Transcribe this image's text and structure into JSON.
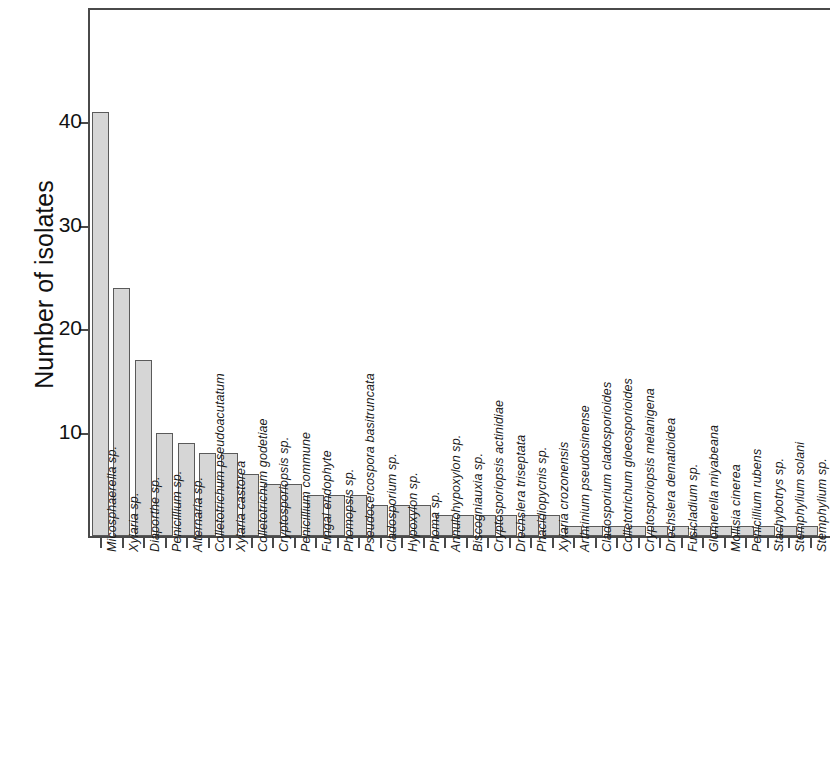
{
  "chart_data": {
    "type": "bar",
    "title": "",
    "xlabel": "",
    "ylabel": "Number of isolates",
    "ylim": [
      0,
      49
    ],
    "yticks": [
      10,
      20,
      30,
      40
    ],
    "ytick_labels": [
      "10",
      "20",
      "30",
      "40"
    ],
    "grid": false,
    "legend": false,
    "orientation": "vertical",
    "bar_color": "#d6d6d6",
    "bar_edge_color": "#5a5a5a",
    "axis_color": "#4a4a4a",
    "categories": [
      "Micosphaerella sp.",
      "Xylaria sp.",
      "Diaporthe sp.",
      "Penicillium sp.",
      "Alternaria sp.",
      "Colletotrichum pseudoacutatum",
      "Xylaria castorea",
      "Colletotrichum godetiae",
      "Cryptosporiopsis sp.",
      "Penicillium commune",
      "Fungal endophyte",
      "Phomopsis sp.",
      "Pseudocercospora basitruncata",
      "Cladosporium sp.",
      "Hypoxylon sp.",
      "Phoma sp.",
      "Annulohypoxylon sp.",
      "Biscogniauxia sp.",
      "Cryptosporiopsis actinidiae",
      "Drechslera triseptata",
      "Phacidiopycnis sp.",
      "Xylaria crozonensis",
      "Arthrinium pseudosinense",
      "Cladosporium cladosporioides",
      "Colletotrichum gloeosporioides",
      "Cryptosporiopsis melanigena",
      "Drechslera dematioidea",
      "Fusicladium sp.",
      "Glomerella miyabeana",
      "Mollisia cinerea",
      "Penicillium rubens",
      "Stachybotrys sp.",
      "Stemphylium solani",
      "Stemphylium sp."
    ],
    "values": [
      41,
      24,
      17,
      10,
      9,
      8,
      8,
      6,
      5,
      5,
      4,
      4,
      4,
      3,
      3,
      3,
      2,
      2,
      2,
      2,
      2,
      2,
      1,
      1,
      1,
      1,
      1,
      1,
      1,
      1,
      1,
      1,
      1,
      1
    ]
  }
}
